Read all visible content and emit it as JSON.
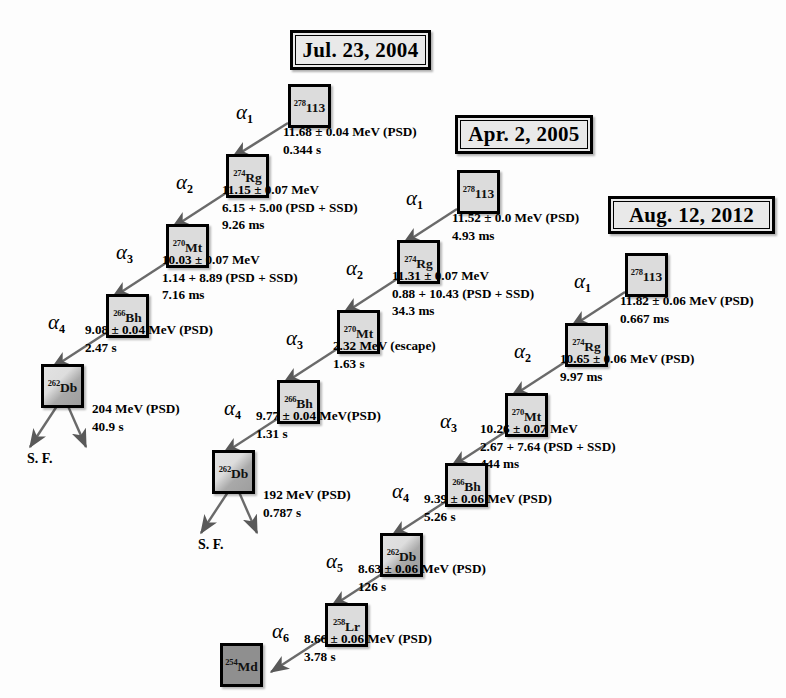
{
  "figure": {
    "box_fill_light": "#dcdcdc",
    "box_fill_dark": "#8f8f8f",
    "border_color": "#000000"
  },
  "chains": [
    {
      "id": "chain-1",
      "date": "Jul. 23, 2004",
      "parent": {
        "mass": "278",
        "symbol": "113"
      },
      "steps": [
        {
          "alpha": "α",
          "index": "1",
          "daughter": {
            "mass": "274",
            "symbol": "Rg",
            "fill": "light"
          },
          "lines": [
            "11.68 ± 0.04 MeV (PSD)",
            "0.344 s"
          ]
        },
        {
          "alpha": "α",
          "index": "2",
          "daughter": {
            "mass": "270",
            "symbol": "Mt",
            "fill": "light"
          },
          "lines": [
            "11.15 ± 0.07 MeV",
            "6.15 + 5.00 (PSD + SSD)",
            "9.26 ms"
          ]
        },
        {
          "alpha": "α",
          "index": "3",
          "daughter": {
            "mass": "266",
            "symbol": "Bh",
            "fill": "light"
          },
          "lines": [
            "10.03 ± 0.07 MeV",
            "1.14 + 8.89 (PSD + SSD)",
            "7.16 ms"
          ]
        },
        {
          "alpha": "α",
          "index": "4",
          "daughter": {
            "mass": "262",
            "symbol": "Db",
            "fill": "grad"
          },
          "lines": [
            "9.08 ± 0.04 MeV (PSD)",
            "2.47 s"
          ]
        }
      ],
      "fission": {
        "label": "S. F.",
        "lines": [
          "204 MeV (PSD)",
          "40.9 s"
        ]
      }
    },
    {
      "id": "chain-2",
      "date": "Apr. 2, 2005",
      "parent": {
        "mass": "278",
        "symbol": "113"
      },
      "steps": [
        {
          "alpha": "α",
          "index": "1",
          "daughter": {
            "mass": "274",
            "symbol": "Rg",
            "fill": "light"
          },
          "lines": [
            "11.52 ± 0.0 MeV (PSD)",
            "4.93 ms"
          ]
        },
        {
          "alpha": "α",
          "index": "2",
          "daughter": {
            "mass": "270",
            "symbol": "Mt",
            "fill": "light"
          },
          "lines": [
            "11.31 ± 0.07 MeV",
            "0.88 + 10.43 (PSD + SSD)",
            "34.3 ms"
          ]
        },
        {
          "alpha": "α",
          "index": "3",
          "daughter": {
            "mass": "266",
            "symbol": "Bh",
            "fill": "light"
          },
          "lines": [
            "2.32 MeV (escape)",
            "1.63 s"
          ]
        },
        {
          "alpha": "α",
          "index": "4",
          "daughter": {
            "mass": "262",
            "symbol": "Db",
            "fill": "grad"
          },
          "lines": [
            "9.77 ± 0.04 MeV(PSD)",
            "1.31 s"
          ]
        }
      ],
      "fission": {
        "label": "S. F.",
        "lines": [
          "192 MeV (PSD)",
          "0.787 s"
        ]
      }
    },
    {
      "id": "chain-3",
      "date": "Aug. 12, 2012",
      "parent": {
        "mass": "278",
        "symbol": "113"
      },
      "steps": [
        {
          "alpha": "α",
          "index": "1",
          "daughter": {
            "mass": "274",
            "symbol": "Rg",
            "fill": "light"
          },
          "lines": [
            "11.82 ± 0.06 MeV (PSD)",
            "0.667 ms"
          ]
        },
        {
          "alpha": "α",
          "index": "2",
          "daughter": {
            "mass": "270",
            "symbol": "Mt",
            "fill": "light"
          },
          "lines": [
            "10.65 ± 0.06 MeV (PSD)",
            "9.97 ms"
          ]
        },
        {
          "alpha": "α",
          "index": "3",
          "daughter": {
            "mass": "266",
            "symbol": "Bh",
            "fill": "light"
          },
          "lines": [
            "10.26 ± 0.07 MeV",
            "2.67 + 7.64 (PSD + SSD)",
            "444 ms"
          ]
        },
        {
          "alpha": "α",
          "index": "4",
          "daughter": {
            "mass": "262",
            "symbol": "Db",
            "fill": "grad"
          },
          "lines": [
            "9.39 ± 0.06 MeV (PSD)",
            "5.26 s"
          ]
        },
        {
          "alpha": "α",
          "index": "5",
          "daughter": {
            "mass": "258",
            "symbol": "Lr",
            "fill": "light"
          },
          "lines": [
            "8.63 ± 0.06 MeV (PSD)",
            "126 s"
          ]
        },
        {
          "alpha": "α",
          "index": "6",
          "daughter": {
            "mass": "254",
            "symbol": "Md",
            "fill": "dark"
          },
          "lines": [
            "8.66 ± 0.06 MeV (PSD)",
            "3.78 s"
          ]
        }
      ],
      "fission": null
    }
  ],
  "labels": {
    "c1": {
      "date": "Jul. 23, 2004",
      "n0": "278|113",
      "n1": "274|Rg",
      "n2": "270|Mt",
      "n3": "266|Bh",
      "n4": "262|Db",
      "a1": "1",
      "a2": "2",
      "a3": "3",
      "a4": "4",
      "t1a": "11.68 ± 0.04 MeV (PSD)",
      "t1b": "0.344 s",
      "t2a": "11.15 ± 0.07 MeV",
      "t2b": "6.15 + 5.00 (PSD + SSD)",
      "t2c": "9.26 ms",
      "t3a": "10.03 ± 0.07 MeV",
      "t3b": "1.14 + 8.89 (PSD + SSD)",
      "t3c": "7.16 ms",
      "t4a": "9.08 ± 0.04 MeV (PSD)",
      "t4b": "2.47 s",
      "sfa": "204 MeV (PSD)",
      "sfb": "40.9 s",
      "sf": "S. F."
    },
    "c2": {
      "date": "Apr. 2, 2005",
      "n0": "278|113",
      "n1": "274|Rg",
      "n2": "270|Mt",
      "n3": "266|Bh",
      "n4": "262|Db",
      "a1": "1",
      "a2": "2",
      "a3": "3",
      "a4": "4",
      "t1a": "11.52 ± 0.0 MeV (PSD)",
      "t1b": "4.93 ms",
      "t2a": "11.31 ± 0.07 MeV",
      "t2b": "0.88 + 10.43 (PSD + SSD)",
      "t2c": "34.3 ms",
      "t3a": "2.32 MeV (escape)",
      "t3b": "1.63 s",
      "t4a": "9.77 ± 0.04 MeV(PSD)",
      "t4b": "1.31 s",
      "sfa": "192 MeV (PSD)",
      "sfb": "0.787 s",
      "sf": "S. F."
    },
    "c3": {
      "date": "Aug. 12, 2012",
      "n0": "278|113",
      "n1": "274|Rg",
      "n2": "270|Mt",
      "n3": "266|Bh",
      "n4": "262|Db",
      "n5": "258|Lr",
      "n6": "254|Md",
      "a1": "1",
      "a2": "2",
      "a3": "3",
      "a4": "4",
      "a5": "5",
      "a6": "6",
      "t1a": "11.82 ± 0.06 MeV (PSD)",
      "t1b": "0.667 ms",
      "t2a": "10.65 ± 0.06 MeV (PSD)",
      "t2b": "9.97 ms",
      "t3a": "10.26 ± 0.07 MeV",
      "t3b": "2.67 + 7.64 (PSD + SSD)",
      "t3c": "444 ms",
      "t4a": "9.39 ± 0.06 MeV (PSD)",
      "t4b": "5.26 s",
      "t5a": "8.63 ± 0.06 MeV (PSD)",
      "t5b": "126 s",
      "t6a": "8.66 ± 0.06 MeV (PSD)",
      "t6b": "3.78 s"
    }
  }
}
